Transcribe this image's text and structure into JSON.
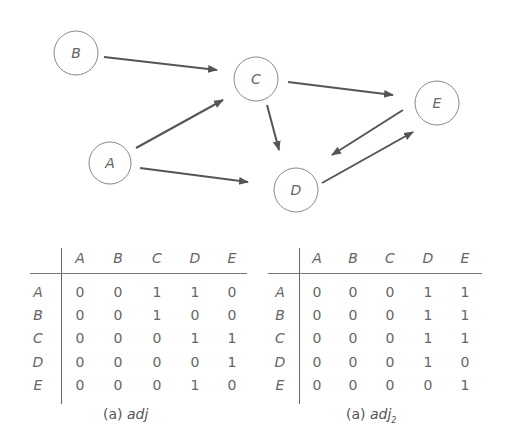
{
  "graph": {
    "nodes": [
      {
        "id": "A",
        "label": "A",
        "cx": 110,
        "cy": 163,
        "r": 21
      },
      {
        "id": "B",
        "label": "B",
        "cx": 76,
        "cy": 53,
        "r": 22
      },
      {
        "id": "C",
        "label": "C",
        "cx": 256,
        "cy": 79,
        "r": 22
      },
      {
        "id": "D",
        "label": "D",
        "cx": 296,
        "cy": 190,
        "r": 22
      },
      {
        "id": "E",
        "label": "E",
        "cx": 437,
        "cy": 103,
        "r": 22
      }
    ],
    "edges": [
      {
        "from": "B",
        "to": "C",
        "x1": 104,
        "y1": 57,
        "x2": 217,
        "y2": 70
      },
      {
        "from": "A",
        "to": "C",
        "x1": 136,
        "y1": 148,
        "x2": 223,
        "y2": 100
      },
      {
        "from": "A",
        "to": "D",
        "x1": 140,
        "y1": 168,
        "x2": 248,
        "y2": 182
      },
      {
        "from": "C",
        "to": "D",
        "x1": 267,
        "y1": 105,
        "x2": 279,
        "y2": 150
      },
      {
        "from": "C",
        "to": "E",
        "x1": 288,
        "y1": 82,
        "x2": 393,
        "y2": 95
      },
      {
        "from": "E",
        "to": "D",
        "x1": 403,
        "y1": 110,
        "x2": 332,
        "y2": 155
      },
      {
        "from": "D",
        "to": "E",
        "x1": 322,
        "y1": 183,
        "x2": 413,
        "y2": 132
      }
    ]
  },
  "matrices": [
    {
      "caption_prefix": "(a)",
      "caption_name": "adj",
      "caption_sub": "",
      "columns": [
        "A",
        "B",
        "C",
        "D",
        "E"
      ],
      "rows": [
        {
          "label": "A",
          "values": [
            "0",
            "0",
            "1",
            "1",
            "0"
          ]
        },
        {
          "label": "B",
          "values": [
            "0",
            "0",
            "1",
            "0",
            "0"
          ]
        },
        {
          "label": "C",
          "values": [
            "0",
            "0",
            "0",
            "1",
            "1"
          ]
        },
        {
          "label": "D",
          "values": [
            "0",
            "0",
            "0",
            "0",
            "1"
          ]
        },
        {
          "label": "E",
          "values": [
            "0",
            "0",
            "0",
            "1",
            "0"
          ]
        }
      ]
    },
    {
      "caption_prefix": "(a)",
      "caption_name": "adj",
      "caption_sub": "2",
      "columns": [
        "A",
        "B",
        "C",
        "D",
        "E"
      ],
      "rows": [
        {
          "label": "A",
          "values": [
            "0",
            "0",
            "0",
            "1",
            "1"
          ]
        },
        {
          "label": "B",
          "values": [
            "0",
            "0",
            "0",
            "1",
            "1"
          ]
        },
        {
          "label": "C",
          "values": [
            "0",
            "0",
            "0",
            "1",
            "1"
          ]
        },
        {
          "label": "D",
          "values": [
            "0",
            "0",
            "0",
            "1",
            "0"
          ]
        },
        {
          "label": "E",
          "values": [
            "0",
            "0",
            "0",
            "0",
            "1"
          ]
        }
      ]
    }
  ]
}
